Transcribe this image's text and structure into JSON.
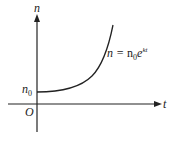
{
  "diagram": {
    "type": "exponential-growth-graph",
    "y_axis_label": "n",
    "x_axis_label": "t",
    "origin_label": "O",
    "intercept_label": {
      "base": "n",
      "sub": "0"
    },
    "curve_equation": {
      "lhs": "n = ",
      "coef": "n",
      "coef_sub": "0",
      "base": "e",
      "exponent": "kt"
    },
    "colors": {
      "stroke": "#222222",
      "background": "#ffffff"
    }
  }
}
